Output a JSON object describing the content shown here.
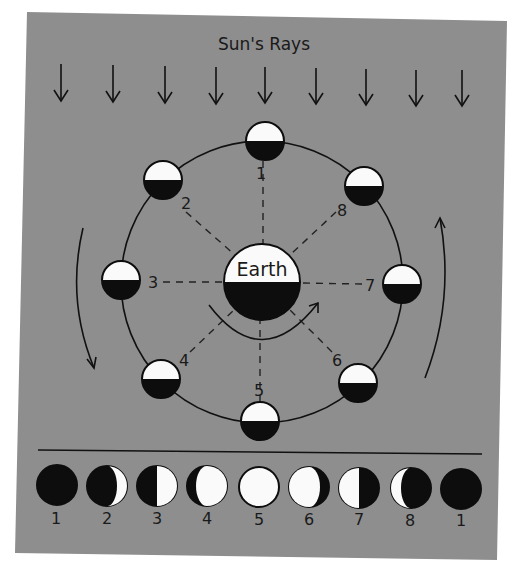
{
  "diagram": {
    "title": "Sun's Rays",
    "center_label": "Earth",
    "colors": {
      "panel": "#8e8e8e",
      "ink": "#0d0d0d",
      "lit": "#fafafa",
      "background": "#ffffff"
    },
    "ray_count": 9,
    "orbit_positions": [
      {
        "label": "1",
        "angle_deg": -90
      },
      {
        "label": "2",
        "angle_deg": -135
      },
      {
        "label": "3",
        "angle_deg": 180
      },
      {
        "label": "4",
        "angle_deg": 135
      },
      {
        "label": "5",
        "angle_deg": 90
      },
      {
        "label": "6",
        "angle_deg": 45
      },
      {
        "label": "7",
        "angle_deg": 0
      },
      {
        "label": "8",
        "angle_deg": -45
      }
    ],
    "orbit_direction": "counterclockwise",
    "phases": [
      {
        "label": "1",
        "name": "new moon"
      },
      {
        "label": "2",
        "name": "waxing crescent"
      },
      {
        "label": "3",
        "name": "first quarter"
      },
      {
        "label": "4",
        "name": "waxing gibbous"
      },
      {
        "label": "5",
        "name": "full moon"
      },
      {
        "label": "6",
        "name": "waning gibbous"
      },
      {
        "label": "7",
        "name": "last quarter"
      },
      {
        "label": "8",
        "name": "waning crescent"
      },
      {
        "label": "1",
        "name": "new moon"
      }
    ]
  }
}
